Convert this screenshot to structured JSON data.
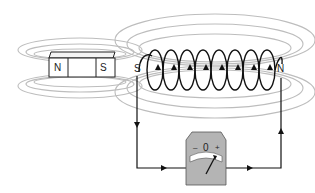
{
  "diagram": {
    "title": "",
    "magnet": {
      "left_pole": "N",
      "right_pole": "S"
    },
    "coil": {
      "left_pole": "S",
      "right_pole": "N",
      "turns": 9
    },
    "meter": {
      "minus": "–",
      "zero": "0",
      "plus": "+"
    },
    "colors": {
      "field_lines": "#b8b8b8",
      "wire": "#111111",
      "meter_body": "#b4b4b4",
      "meter_dial": "#ffffff"
    }
  }
}
